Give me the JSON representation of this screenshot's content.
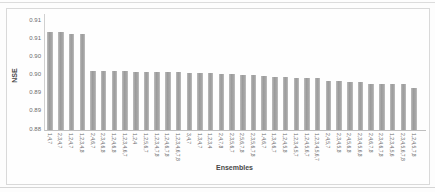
{
  "figure": {
    "y_axis_title": "NSE",
    "x_axis_title": "Ensembles"
  },
  "chart_data": {
    "type": "bar",
    "title": "",
    "xlabel": "Ensembles",
    "ylabel": "NSE",
    "ylim": [
      0.88,
      0.91
    ],
    "ytick_values": [
      0.88,
      0.885,
      0.89,
      0.895,
      0.9,
      0.905,
      0.91
    ],
    "ytick_labels": [
      "0.88",
      "0.89",
      "0.89",
      "0.90",
      "0.90",
      "0.91",
      "0.91"
    ],
    "grid": false,
    "legend": "none",
    "bar_color": "#a3a3a3",
    "categories": [
      "1,4,7",
      "2,3,4,7",
      "1,2,4,7",
      "1,2,3,4,8",
      "2,4,6,7",
      "2,3,4,6,8",
      "1,2,4,6,8",
      "1,2,3,4,6,7",
      "1,2,4",
      "1,2,5,6,7",
      "1,2,3,4,7,8",
      "1,2,4,6,7,8",
      "1,2,3,4,6,7,8",
      "3,4,7",
      "1,3,4,7",
      "1,2,3,4",
      "2,4,7,8",
      "2,3,5,6,7",
      "2,5,6,7,8",
      "2,3,5,6,7,8",
      "1,4,6,7",
      "1,3,4,6,7",
      "1,2,4,5,8",
      "1,2,3,4,5,7",
      "1,2,4,5,6,7",
      "1,2,3,4,5,6,7",
      "2,4,5,7",
      "2,3,4,5,8",
      "2,4,5,6,8",
      "2,3,4,5,6,8",
      "2,4,6,7,8",
      "2,3,4,6,7,8",
      "1,2,3,4,5,6",
      "2,3,4,5,6,7,8",
      "1,2,4,5,7,8"
    ],
    "values": [
      0.907,
      0.907,
      0.9065,
      0.9065,
      0.8963,
      0.8963,
      0.8962,
      0.8962,
      0.8961,
      0.896,
      0.896,
      0.896,
      0.8959,
      0.8958,
      0.8958,
      0.8957,
      0.8955,
      0.8953,
      0.8952,
      0.8952,
      0.8948,
      0.8946,
      0.8945,
      0.8944,
      0.8943,
      0.8942,
      0.8935,
      0.8934,
      0.8933,
      0.8933,
      0.8928,
      0.8927,
      0.8927,
      0.8926,
      0.8916
    ]
  }
}
